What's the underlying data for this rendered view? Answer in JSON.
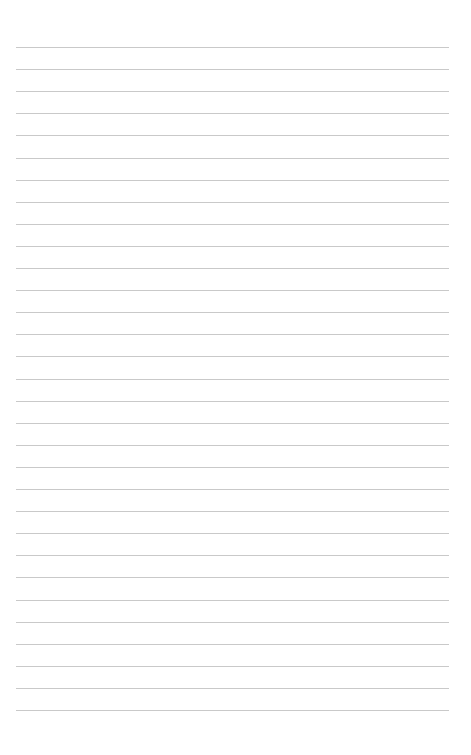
{
  "page": {
    "type": "blank lined notebook page",
    "background_color": "#ffffff",
    "rule_color": "#c9c9c9",
    "rule_count": 31,
    "rule_first_y": 47,
    "rule_spacing": 22.1,
    "rule_left_x": 16,
    "rule_right_x": 449,
    "handwritten_text": []
  }
}
